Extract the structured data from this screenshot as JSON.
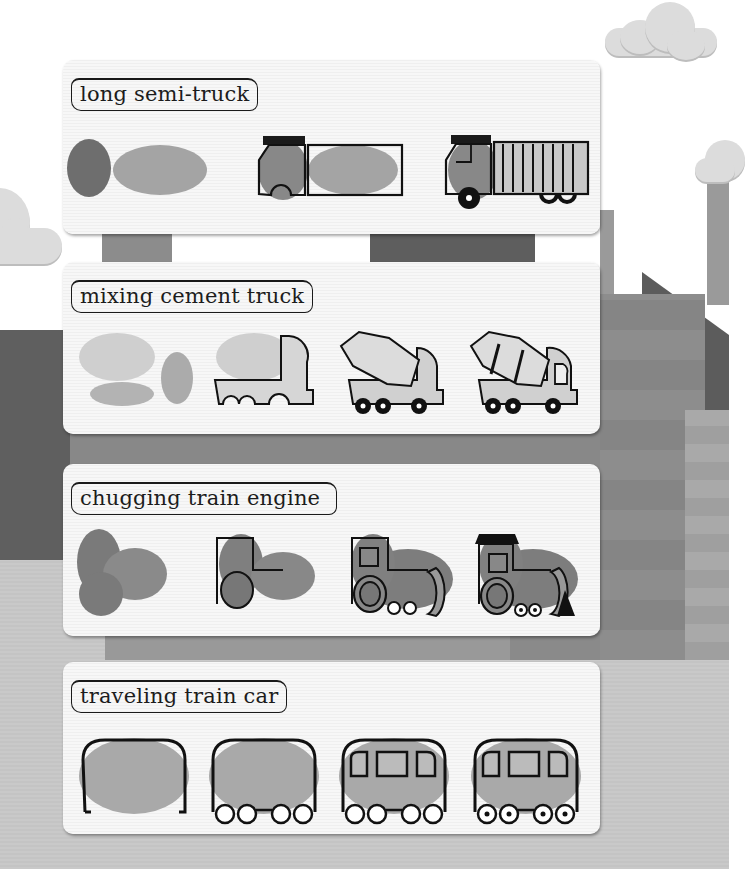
{
  "page": {
    "background": {
      "sky_color": "#ffffff",
      "ground_color": "#c7c7c7",
      "building_colors": [
        "#6e6e6e",
        "#8a8a8a",
        "#9c9c9c",
        "#5c5c5c",
        "#a8a8a8"
      ]
    },
    "sections": [
      {
        "title": "long semi-truck",
        "steps": [
          {
            "step": 1,
            "description": "two fingerprints: small dark oval and wide light oval"
          },
          {
            "step": 2,
            "description": "outline cab and trailer box"
          },
          {
            "step": 3,
            "description": "add window, wheels and vertical trailer stripes"
          }
        ]
      },
      {
        "title": "mixing cement truck",
        "steps": [
          {
            "step": 1,
            "description": "three fingerprints: large light oval, small oval, flat oval"
          },
          {
            "step": 2,
            "description": "outline cab and flatbed with wheel arches"
          },
          {
            "step": 3,
            "description": "add drum outline and wheels"
          },
          {
            "step": 4,
            "description": "add drum stripes and window"
          }
        ]
      },
      {
        "title": "chugging train engine",
        "steps": [
          {
            "step": 1,
            "description": "two fingerprints: tall oval and round oval"
          },
          {
            "step": 2,
            "description": "outline cab, body and big wheel"
          },
          {
            "step": 3,
            "description": "add window, front cap and small wheels"
          },
          {
            "step": 4,
            "description": "add roof and cow catcher"
          }
        ]
      },
      {
        "title": "traveling train car",
        "steps": [
          {
            "step": 1,
            "description": "wide fingerprint with car outline"
          },
          {
            "step": 2,
            "description": "add four wheels"
          },
          {
            "step": 3,
            "description": "add three windows"
          },
          {
            "step": 4,
            "description": "add wheel centers"
          }
        ]
      }
    ]
  }
}
